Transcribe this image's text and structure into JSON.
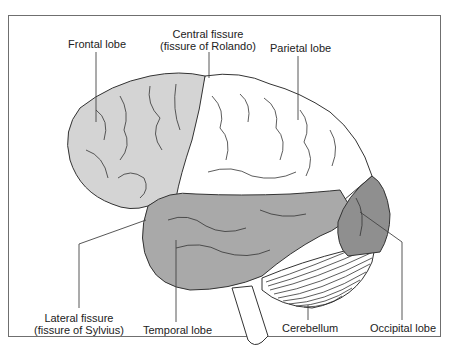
{
  "diagram": {
    "type": "anatomical-brain-lateral-view",
    "colors": {
      "frontal": "#d4d4d4",
      "parietal": "#ffffff",
      "temporal": "#a9a9a9",
      "occipital": "#8f8f8f",
      "cerebellum": "#ffffff",
      "outline": "#333333",
      "frame": "#6f6f6f",
      "text": "#222222"
    },
    "labels": {
      "frontal_lobe": "Frontal lobe",
      "central_fissure_line1": "Central fissure",
      "central_fissure_line2": "(fissure of Rolando)",
      "parietal_lobe": "Parietal lobe",
      "lateral_fissure_line1": "Lateral fissure",
      "lateral_fissure_line2": "(fissure of Sylvius)",
      "temporal_lobe": "Temporal lobe",
      "cerebellum": "Cerebellum",
      "occipital_lobe": "Occipital lobe"
    }
  }
}
